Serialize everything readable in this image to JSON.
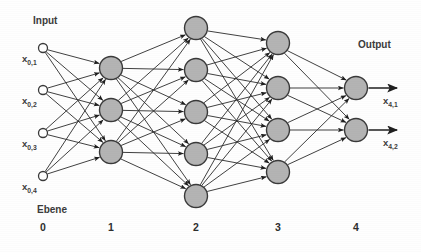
{
  "figure": {
    "title_input": "Input",
    "title_output": "Output",
    "layer_caption": "Ebene"
  },
  "layers": [
    {
      "index": 0,
      "number_label": "0",
      "kind": "input",
      "x": 43,
      "radius": 4.5,
      "nodes": [
        {
          "cy": 48,
          "label_base": "x",
          "label_sub": "0,1",
          "label_x": 22,
          "label_y": 62
        },
        {
          "cy": 90,
          "label_base": "x",
          "label_sub": "0,2",
          "label_x": 22,
          "label_y": 104
        },
        {
          "cy": 133,
          "label_base": "x",
          "label_sub": "0,3",
          "label_x": 22,
          "label_y": 147
        },
        {
          "cy": 176,
          "label_base": "x",
          "label_sub": "0,4",
          "label_x": 22,
          "label_y": 190
        }
      ]
    },
    {
      "index": 1,
      "number_label": "1",
      "kind": "hidden",
      "x": 111,
      "radius": 11.5,
      "nodes": [
        {
          "cy": 68
        },
        {
          "cy": 110
        },
        {
          "cy": 152
        }
      ]
    },
    {
      "index": 2,
      "number_label": "2",
      "kind": "hidden",
      "x": 196,
      "radius": 11.5,
      "nodes": [
        {
          "cy": 28
        },
        {
          "cy": 70
        },
        {
          "cy": 112
        },
        {
          "cy": 154
        },
        {
          "cy": 196
        }
      ]
    },
    {
      "index": 3,
      "number_label": "3",
      "kind": "hidden",
      "x": 278,
      "radius": 11.5,
      "nodes": [
        {
          "cy": 43
        },
        {
          "cy": 88
        },
        {
          "cy": 130
        },
        {
          "cy": 172
        }
      ]
    },
    {
      "index": 4,
      "number_label": "4",
      "kind": "output",
      "x": 356,
      "radius": 11.5,
      "nodes": [
        {
          "cy": 88,
          "label_base": "x",
          "label_sub": "4,1",
          "label_x": 383,
          "label_y": 104
        },
        {
          "cy": 130,
          "label_base": "x",
          "label_sub": "4,2",
          "label_x": 383,
          "label_y": 146
        }
      ]
    }
  ],
  "annotations": {
    "input_label_x": 33,
    "input_label_y": 24,
    "output_label_x": 358,
    "output_label_y": 48,
    "ebene_label_x": 37,
    "ebene_label_y": 213,
    "layer_number_y": 231
  },
  "colors": {
    "node_fill": "#b4b4b4",
    "node_stroke": "#3a3a3a",
    "input_fill": "#ffffff",
    "edge": "#2b2b2b",
    "text": "#3b3b3b",
    "background": "#fefefe"
  }
}
